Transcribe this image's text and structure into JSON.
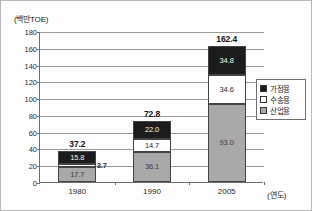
{
  "chart_data": {
    "type": "bar",
    "stacked": true,
    "title": "",
    "unit_label": "(백만TOE)",
    "xlabel": "(연도)",
    "ylabel": "",
    "categories": [
      "1980",
      "1990",
      "2005"
    ],
    "ylim": [
      0,
      180
    ],
    "yticks": [
      0,
      20,
      40,
      60,
      80,
      100,
      120,
      140,
      160,
      180
    ],
    "ytick_labels": [
      "0",
      "20",
      "40",
      "60",
      "80",
      "100",
      "120",
      "140",
      "160",
      "180"
    ],
    "grid": true,
    "legend_position": "right",
    "series": [
      {
        "name": "산업용",
        "key": "industrial",
        "color": "#a9a9a9",
        "values": [
          17.7,
          36.1,
          93.0
        ],
        "labels": [
          "17.7",
          "36.1",
          "93.0"
        ]
      },
      {
        "name": "수송용",
        "key": "transport",
        "color": "#ffffff",
        "values": [
          3.7,
          14.7,
          34.6
        ],
        "labels": [
          "3.7",
          "14.7",
          "34.6"
        ]
      },
      {
        "name": "가정용",
        "key": "residential",
        "color": "#1c1c1c",
        "values": [
          15.8,
          22.0,
          34.8
        ],
        "labels": [
          "15.8",
          "22.0",
          "34.8"
        ]
      }
    ],
    "totals": [
      37.2,
      72.8,
      162.4
    ],
    "total_labels": [
      "37.2",
      "72.8",
      "162.4"
    ]
  },
  "legend": {
    "items": [
      {
        "label": "가정용",
        "swatch": "black-swatch-icon"
      },
      {
        "label": "수송용",
        "swatch": "white-swatch-icon"
      },
      {
        "label": "산업용",
        "swatch": "gray-swatch-icon"
      }
    ]
  },
  "axes": {
    "y_unit": "(백만TOE)",
    "x_title": "(연도)"
  }
}
